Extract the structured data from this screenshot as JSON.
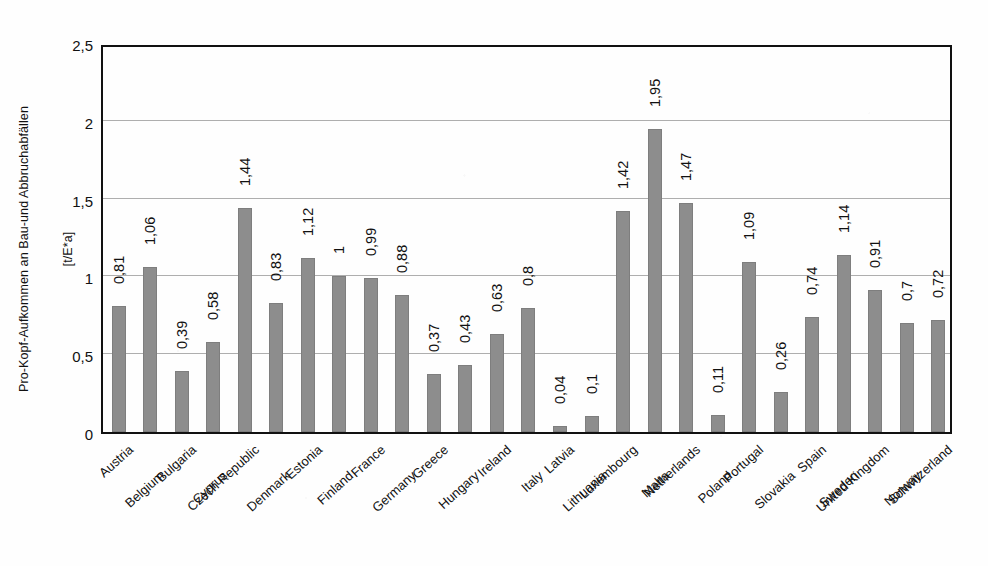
{
  "chart_data": {
    "type": "bar",
    "title": "",
    "xlabel": "",
    "ylabel_line1": "Pro-Kopf-Aufkommen an Bau-und Abbruchabfällen",
    "ylabel_line2": "[t/E*a]",
    "ylim": [
      0,
      2.5
    ],
    "ytick_labels": [
      "0",
      "0,5",
      "1",
      "1,5",
      "2",
      "2,5"
    ],
    "ytick_values": [
      0,
      0.5,
      1,
      1.5,
      2,
      2.5
    ],
    "grid": "horizontal",
    "legend": "none",
    "decimal_separator": ",",
    "bar_color": "#8d8d8d",
    "axis_color": "#111111",
    "gridline_color": "#aeaeae",
    "categories": [
      "Austria",
      "Belgium",
      "Bulgaria",
      "Cyprus",
      "Czech Republic",
      "Denmark",
      "Estonia",
      "Finland",
      "France",
      "Germany",
      "Greece",
      "Hungary",
      "Ireland",
      "Italy",
      "Latvia",
      "Lithuania",
      "Luxembourg",
      "Malta",
      "Netherlands",
      "Poland",
      "Portugal",
      "Slovakia",
      "Spain",
      "Sweden",
      "United Kingdom",
      "Norway",
      "Schwitzerland"
    ],
    "values": [
      0.81,
      1.06,
      0.39,
      0.58,
      1.44,
      0.83,
      1.12,
      1,
      0.99,
      0.88,
      0.37,
      0.43,
      0.63,
      0.8,
      0.04,
      0.1,
      1.42,
      1.95,
      1.47,
      0.11,
      1.09,
      0.26,
      0.74,
      1.14,
      0.91,
      0.7,
      0.72
    ],
    "value_labels": [
      "0,81",
      "1,06",
      "0,39",
      "0,58",
      "1,44",
      "0,83",
      "1,12",
      "1",
      "0,99",
      "0,88",
      "0,37",
      "0,43",
      "0,63",
      "0,8",
      "0,04",
      "0,1",
      "1,42",
      "1,95",
      "1,47",
      "0,11",
      "1,09",
      "0,26",
      "0,74",
      "1,14",
      "0,91",
      "0,7",
      "0,72"
    ]
  }
}
